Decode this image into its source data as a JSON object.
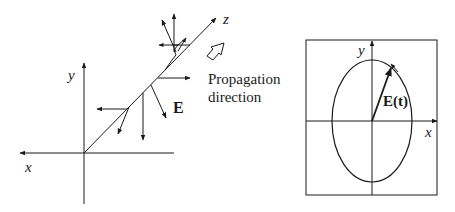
{
  "figure": {
    "left_panel": {
      "title": "Elliptically polarized wave propagating along z",
      "axis_labels": {
        "x": "x",
        "y": "y",
        "z": "z"
      },
      "field_label": "E",
      "propagation_label_line1": "Propagation",
      "propagation_label_line2": "direction"
    },
    "right_panel": {
      "title": "Polarization ellipse in the x-y plane",
      "axis_labels": {
        "x": "x",
        "y": "y"
      },
      "field_label": "E(t)",
      "rotation": "counterclockwise"
    },
    "colors": {
      "stroke": "#1a1a1a",
      "background": "#ffffff"
    }
  }
}
